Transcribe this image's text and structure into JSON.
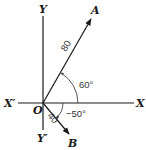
{
  "diagram": {
    "type": "vector-diagram",
    "colors": {
      "line": "#1a1a1a",
      "text": "#1a1a1a",
      "angle_text": "#333333",
      "background": "#ffffff"
    },
    "axes": {
      "x_positive_label": "X",
      "x_negative_label": "X′",
      "y_positive_label": "Y",
      "y_negative_label": "Y′",
      "origin_label": "O"
    },
    "vectors": [
      {
        "name": "A",
        "magnitude_label": "80",
        "angle_label": "60°",
        "angle_deg": 60
      },
      {
        "name": "B",
        "magnitude_label": "40",
        "angle_label": "−50°",
        "angle_deg": -50
      }
    ]
  }
}
